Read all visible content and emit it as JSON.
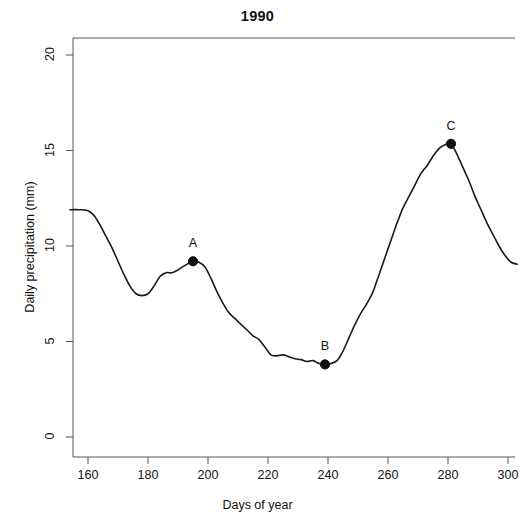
{
  "chart_data": {
    "type": "line",
    "title": "1990",
    "xlabel": "Days of year",
    "ylabel": "Daily precipitation (mm)",
    "xlim": [
      154,
      303
    ],
    "ylim": [
      0,
      21
    ],
    "grid": false,
    "legend": null,
    "xticks": [
      160,
      180,
      200,
      220,
      240,
      260,
      280,
      300
    ],
    "xtick_labels": [
      "160",
      "180",
      "200",
      "220",
      "240",
      "260",
      "280",
      "300"
    ],
    "yticks": [
      0,
      5,
      10,
      15,
      20
    ],
    "ytick_labels": [
      "0",
      "5",
      "10",
      "15",
      "20"
    ],
    "series": [
      {
        "name": "Daily precipitation",
        "color": "#1a1a1a",
        "x": [
          154,
          157,
          160,
          162,
          164,
          166,
          168,
          170,
          172,
          174,
          176,
          178,
          180,
          182,
          184,
          186,
          188,
          190,
          192,
          195,
          197,
          199,
          201,
          203,
          205,
          207,
          209,
          211,
          213,
          215,
          217,
          219,
          221,
          223,
          225,
          227,
          229,
          231,
          233,
          235,
          237,
          239,
          241,
          243,
          245,
          247,
          249,
          251,
          253,
          255,
          257,
          259,
          261,
          263,
          265,
          267,
          269,
          271,
          273,
          275,
          277,
          279,
          281,
          283,
          285,
          287,
          289,
          291,
          293,
          295,
          297,
          299,
          301,
          303
        ],
        "y": [
          11.9,
          11.9,
          11.85,
          11.6,
          11.1,
          10.5,
          9.9,
          9.2,
          8.5,
          7.9,
          7.5,
          7.4,
          7.5,
          7.9,
          8.4,
          8.6,
          8.6,
          8.75,
          8.95,
          9.2,
          9.15,
          8.9,
          8.3,
          7.6,
          7.0,
          6.5,
          6.2,
          5.9,
          5.6,
          5.3,
          5.1,
          4.7,
          4.3,
          4.25,
          4.3,
          4.2,
          4.1,
          4.05,
          3.95,
          4.0,
          3.85,
          3.8,
          3.85,
          4.0,
          4.5,
          5.2,
          5.9,
          6.5,
          7.0,
          7.6,
          8.5,
          9.4,
          10.3,
          11.2,
          12.0,
          12.6,
          13.2,
          13.8,
          14.2,
          14.7,
          15.1,
          15.3,
          15.35,
          14.8,
          14.1,
          13.4,
          12.6,
          11.9,
          11.2,
          10.6,
          10.0,
          9.5,
          9.15,
          9.05
        ]
      }
    ],
    "annotated_points": [
      {
        "label": "A",
        "x": 195,
        "y": 9.2
      },
      {
        "label": "B",
        "x": 239,
        "y": 3.8
      },
      {
        "label": "C",
        "x": 281,
        "y": 15.35
      }
    ]
  }
}
